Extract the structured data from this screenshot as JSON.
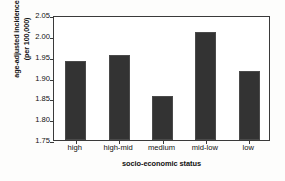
{
  "chart_data": {
    "type": "bar",
    "title": "",
    "categories": [
      "high",
      "high-mid",
      "medium",
      "mid-low",
      "low"
    ],
    "values": [
      1.94,
      1.955,
      1.855,
      2.01,
      1.915
    ],
    "xlabel": "socio-economic status",
    "ylabel": "age-adjusted incidence (per 100,000)",
    "ylabel_line1": "age-adjusted incidence",
    "ylabel_line2": "(per 100,000)",
    "ylim": [
      1.75,
      2.05
    ],
    "ytick_labels": [
      "2.05",
      "2.00",
      "1.95",
      "1.90",
      "1.85",
      "1.80",
      "1.75"
    ],
    "ytick_values": [
      2.05,
      2.0,
      1.95,
      1.9,
      1.85,
      1.8,
      1.75
    ],
    "grid": false,
    "legend": "none",
    "bar_color": "#333333",
    "axis_color": "#3a3a3a",
    "background_color": "#ffffff"
  }
}
